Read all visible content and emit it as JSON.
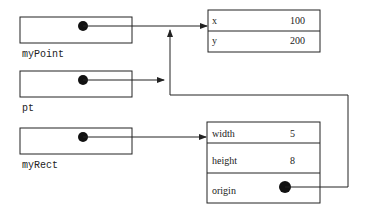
{
  "variables": [
    {
      "name": "myPoint"
    },
    {
      "name": "pt"
    },
    {
      "name": "myRect"
    }
  ],
  "point_object": {
    "fields": [
      {
        "name": "x",
        "value": "100"
      },
      {
        "name": "y",
        "value": "200"
      }
    ]
  },
  "rect_object": {
    "fields": [
      {
        "name": "width",
        "value": "5"
      },
      {
        "name": "height",
        "value": "8"
      },
      {
        "name": "origin",
        "value": ""
      }
    ]
  },
  "colors": {
    "stroke": "#222222",
    "background": "#ffffff"
  }
}
